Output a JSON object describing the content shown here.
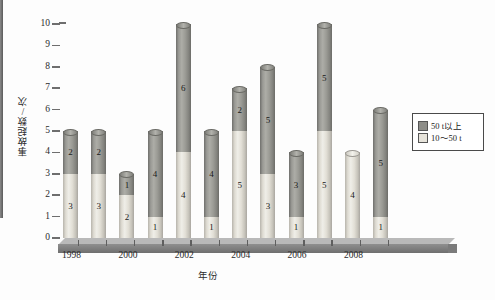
{
  "chart_data": {
    "type": "bar",
    "title": "",
    "subtitle": "",
    "xlabel": "年份",
    "ylabel": "事故起数/次",
    "stacked": true,
    "grid": false,
    "legend_position": "right",
    "ylim": [
      0,
      10
    ],
    "ytick_labels": [
      "0",
      "1",
      "2",
      "3",
      "4",
      "5",
      "6",
      "7",
      "8",
      "9",
      "10"
    ],
    "categories": [
      "1998",
      "1999",
      "2000",
      "2001",
      "2002",
      "2003",
      "2004",
      "2005",
      "2006",
      "2007",
      "2008",
      "2009"
    ],
    "xtick_labels": [
      "1998",
      "",
      "2000",
      "",
      "2002",
      "",
      "2004",
      "",
      "2006",
      "",
      "2008",
      ""
    ],
    "series": [
      {
        "name": "10～50 t",
        "color": "#e6e3da",
        "values": [
          3,
          3,
          2,
          1,
          4,
          1,
          5,
          3,
          1,
          5,
          4,
          1
        ]
      },
      {
        "name": "50 t以上",
        "color": "#8d8d88",
        "values": [
          2,
          2,
          1,
          4,
          6,
          4,
          2,
          5,
          3,
          5,
          0,
          5
        ]
      }
    ],
    "totals": [
      5,
      5,
      3,
      5,
      10,
      5,
      7,
      8,
      4,
      10,
      4,
      6
    ]
  },
  "legend": {
    "items": [
      {
        "label": "50 t以上",
        "swatch": "dark"
      },
      {
        "label": "10～50 t",
        "swatch": "light"
      }
    ]
  }
}
